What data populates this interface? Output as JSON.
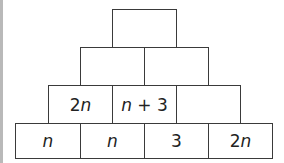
{
  "pyramid": {
    "rows": [
      {
        "cells": [
          {
            "label": ""
          }
        ]
      },
      {
        "cells": [
          {
            "label": ""
          },
          {
            "label": ""
          }
        ]
      },
      {
        "cells": [
          {
            "label": "2n"
          },
          {
            "label": "n + 3"
          },
          {
            "label": ""
          }
        ]
      },
      {
        "cells": [
          {
            "label": "n"
          },
          {
            "label": "n"
          },
          {
            "label": "3"
          },
          {
            "label": "2n"
          }
        ]
      }
    ]
  },
  "colors": {
    "border": "#3a3a3a",
    "background": "#ffffff",
    "left_edge": "#b9b9b9"
  }
}
